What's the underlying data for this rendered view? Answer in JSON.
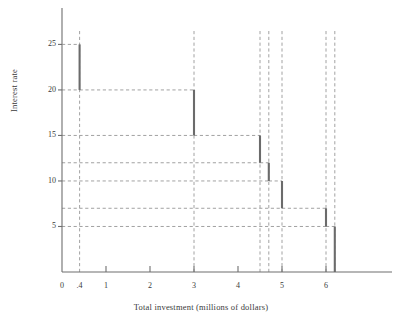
{
  "chart_data": {
    "type": "bar",
    "title": "",
    "subtitle": "",
    "xlabel": "Total investment (millions of dollars)",
    "ylabel": "Interest rate",
    "xlim": [
      0,
      7.5
    ],
    "ylim": [
      0,
      29
    ],
    "grid": "dashed-guides",
    "legend": "none",
    "x_tick_labels": [
      "0",
      ".4",
      "1",
      "2",
      "3",
      "4",
      "5",
      "6"
    ],
    "x_tick_values": [
      0,
      0.4,
      1,
      2,
      3,
      4,
      5,
      6
    ],
    "x_major_ticks": [
      0,
      1,
      2,
      3,
      4,
      5,
      6
    ],
    "y_tick_labels": [
      "5",
      "10",
      "15",
      "20",
      "25"
    ],
    "y_tick_values": [
      5,
      10,
      15,
      20,
      25
    ],
    "categories": [
      "0.4",
      "3",
      "4.5",
      "4.7",
      "5",
      "6",
      "6.2"
    ],
    "values": [
      25,
      20,
      15,
      12,
      10,
      7,
      5
    ],
    "steps": [
      {
        "x": 0.4,
        "top": 25,
        "bottom": 20
      },
      {
        "x": 3.0,
        "top": 20,
        "bottom": 15
      },
      {
        "x": 4.5,
        "top": 15,
        "bottom": 12
      },
      {
        "x": 4.7,
        "top": 12,
        "bottom": 10
      },
      {
        "x": 5.0,
        "top": 10,
        "bottom": 7
      },
      {
        "x": 6.0,
        "top": 7,
        "bottom": 5
      },
      {
        "x": 6.2,
        "top": 5,
        "bottom": 0
      }
    ],
    "horizontal_guides": [
      20,
      15,
      12,
      10,
      7,
      5
    ],
    "vertical_guides": [
      0.4,
      3.0,
      4.5,
      4.7,
      5.0,
      6.0,
      6.2
    ],
    "annotations": []
  },
  "colors": {
    "bar": "#6b6b6b",
    "axis": "#6e6e6e",
    "grid": "#8a8a8a",
    "text": "#3a3a3a",
    "background": "#ffffff"
  }
}
